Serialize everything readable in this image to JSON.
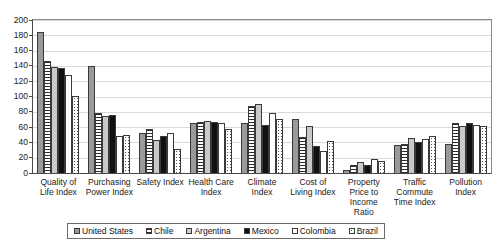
{
  "chart_data": {
    "type": "bar",
    "title": "",
    "subtitle": "",
    "xlabel": "",
    "ylabel": "",
    "ylim": [
      0,
      200
    ],
    "ytick_step": 20,
    "yticks": [
      200,
      180,
      160,
      140,
      120,
      100,
      80,
      60,
      40,
      20,
      0
    ],
    "grid": true,
    "legend_position": "bottom",
    "categories": [
      "Quality of Life Index",
      "Purchasing Power Index",
      "Safety Index",
      "Health Care Index",
      "Climate Index",
      "Cost of Living Index",
      "Property Price to Income Ratio",
      "Traffic Commute Time Index",
      "Pollution Index"
    ],
    "series": [
      {
        "name": "United States",
        "color": "#9a9a9a",
        "pattern": "solid-gray",
        "values": [
          184,
          140,
          52,
          66,
          66,
          70,
          4,
          37,
          38
        ]
      },
      {
        "name": "Chile",
        "color": "#2b2b2b",
        "pattern": "horizontal-stripes",
        "values": [
          146,
          78,
          58,
          67,
          87,
          47,
          10,
          38,
          66
        ]
      },
      {
        "name": "Argentina",
        "color": "#c9c9c9",
        "pattern": "solid-light-gray",
        "values": [
          139,
          74,
          43,
          68,
          90,
          62,
          15,
          46,
          62
        ]
      },
      {
        "name": "Mexico",
        "color": "#111111",
        "pattern": "solid-black",
        "values": [
          137,
          76,
          49,
          67,
          63,
          35,
          11,
          40,
          65
        ]
      },
      {
        "name": "Colombia",
        "color": "#ffffff",
        "pattern": "outline-white",
        "values": [
          128,
          48,
          52,
          66,
          79,
          29,
          18,
          45,
          63
        ]
      },
      {
        "name": "Brazil",
        "color": "#555555",
        "pattern": "dotted",
        "values": [
          101,
          50,
          32,
          57,
          71,
          42,
          16,
          48,
          62
        ]
      }
    ]
  }
}
